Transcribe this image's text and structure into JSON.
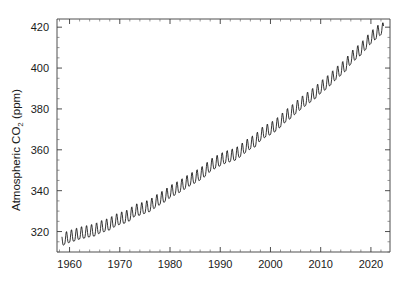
{
  "figure": {
    "background_color": "#ffffff",
    "line_color": "#111111",
    "axis_color": "#3b3b3b"
  },
  "axis": {
    "y_title_main": "Atmospheric CO",
    "y_title_sub": "2",
    "y_title_unit": " (ppm)",
    "y_title_full": "Atmospheric CO2 (ppm)",
    "x_title": ""
  },
  "chart_data": {
    "type": "line",
    "title": "",
    "xlabel": "",
    "ylabel": "Atmospheric CO2 (ppm)",
    "xlim": [
      1957.5,
      2023.8
    ],
    "ylim": [
      310.0,
      424.0
    ],
    "grid": false,
    "legend": null,
    "x_ticks": [
      1960,
      1970,
      1980,
      1990,
      2000,
      2010,
      2020
    ],
    "x_tick_labels": [
      "1960",
      "1970",
      "1980",
      "1990",
      "2000",
      "2010",
      "2020"
    ],
    "x_minor_tick_step": 2,
    "y_ticks": [
      320,
      340,
      360,
      380,
      400,
      420
    ],
    "y_tick_labels": [
      "320",
      "340",
      "360",
      "380",
      "400",
      "420"
    ],
    "y_minor_tick_step": 5,
    "series": [
      {
        "name": "Mauna Loa monthly mean CO2",
        "description": "Monthly mean atmospheric CO2 with seasonal cycle (Keeling Curve)",
        "seasonal_amplitude_ppm": 3.0,
        "x": [
          1958.5,
          1959,
          1960,
          1961,
          1962,
          1963,
          1964,
          1965,
          1966,
          1967,
          1968,
          1969,
          1970,
          1971,
          1972,
          1973,
          1974,
          1975,
          1976,
          1977,
          1978,
          1979,
          1980,
          1981,
          1982,
          1983,
          1984,
          1985,
          1986,
          1987,
          1988,
          1989,
          1990,
          1991,
          1992,
          1993,
          1994,
          1995,
          1996,
          1997,
          1998,
          1999,
          2000,
          2001,
          2002,
          2003,
          2004,
          2005,
          2006,
          2007,
          2008,
          2009,
          2010,
          2011,
          2012,
          2013,
          2014,
          2015,
          2016,
          2017,
          2018,
          2019,
          2020,
          2021,
          2022
        ],
        "annual_mean": [
          315.0,
          315.9,
          316.9,
          317.6,
          318.5,
          319.0,
          319.6,
          320.0,
          321.4,
          322.2,
          323.0,
          324.6,
          325.7,
          326.3,
          327.5,
          329.7,
          330.2,
          331.1,
          332.0,
          333.8,
          335.4,
          336.8,
          338.8,
          340.1,
          341.5,
          343.1,
          344.7,
          346.0,
          347.4,
          349.2,
          351.6,
          353.1,
          354.4,
          355.6,
          356.4,
          357.1,
          358.8,
          360.8,
          362.6,
          363.7,
          366.7,
          368.4,
          369.6,
          371.2,
          373.3,
          375.8,
          377.5,
          379.8,
          381.9,
          383.8,
          385.6,
          387.4,
          389.9,
          391.7,
          393.9,
          396.5,
          398.6,
          400.8,
          404.2,
          406.5,
          408.5,
          411.4,
          414.2,
          416.4,
          418.5
        ],
        "first_value_ppm": 315.0,
        "last_value_ppm": 418.5,
        "units": "ppm"
      }
    ]
  }
}
